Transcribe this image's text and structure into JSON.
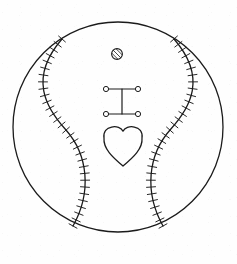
{
  "artwork": {
    "title": "Baseball with Heart Line Drawing",
    "description": "Black-and-white line art of a baseball showing two curved seams with cross stitching, enclosing a small hatched circle, an I-beam shape and a heart outline",
    "style": "line-art",
    "background_color": "#fefefe",
    "stroke_color": "#1b1b1b"
  },
  "canvas": {
    "width": 237,
    "height": 264
  },
  "ball": {
    "name": "baseball-outline",
    "center_x": 118,
    "center_y": 127,
    "radius": 105,
    "stroke_width": 1.3
  },
  "seams": [
    {
      "name": "left-seam",
      "side": "left",
      "path": "M 62 39 C 28 78, 46 108, 66 130 C 88 155, 92 192, 73 226",
      "stitch_count": 30,
      "stitch_length": 9,
      "stroke_width": 1.3
    },
    {
      "name": "right-seam",
      "side": "right",
      "path": "M 174 39 C 208 78, 190 108, 170 130 C 148 155, 144 192, 163 226",
      "stitch_count": 30,
      "stitch_length": 9,
      "stroke_width": 1.3
    }
  ],
  "symbols": [
    {
      "name": "hatched-circle-symbol",
      "type": "circle-with-slash",
      "center_x": 117,
      "center_y": 54,
      "radius": 5.4,
      "hatch_lines": 5,
      "stroke_width": 1.1
    },
    {
      "name": "i-beam-symbol",
      "type": "i-beam",
      "left_x": 106,
      "right_x": 138,
      "top_y": 89,
      "bottom_y": 114,
      "center_x": 122,
      "node_radius": 2.6,
      "stroke_width": 1.2,
      "nodes": [
        {
          "name": "node-top-left",
          "x": 106,
          "y": 89
        },
        {
          "name": "node-top-right",
          "x": 138,
          "y": 89
        },
        {
          "name": "node-bottom-left",
          "x": 106,
          "y": 114
        },
        {
          "name": "node-bottom-right",
          "x": 138,
          "y": 114
        }
      ]
    },
    {
      "name": "heart-symbol",
      "type": "heart",
      "center_x": 123,
      "top_y": 126,
      "bottom_y": 166,
      "left_x": 104,
      "right_x": 142,
      "stroke_width": 1.3
    }
  ]
}
